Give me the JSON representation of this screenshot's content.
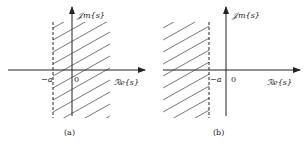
{
  "figure": {
    "panels": [
      {
        "id": "a",
        "caption": "(a)",
        "axes": {
          "x_label": "ℛe{s}",
          "y_label": "𝒥m{s}"
        },
        "marks": {
          "boundary_label": "−a",
          "origin_label": "0"
        },
        "region": "Re{s} > −a (right half-plane shaded)",
        "boundary_style": "dashed"
      },
      {
        "id": "b",
        "caption": "(b)",
        "axes": {
          "x_label": "ℛe{s}",
          "y_label": "𝒥m{s}"
        },
        "marks": {
          "boundary_label": "−a",
          "origin_label": "0"
        },
        "region": "Re{s} < −a (left half-plane shaded)",
        "boundary_style": "dashed"
      }
    ],
    "colors": {
      "line": "#222222",
      "hatch": "#555555",
      "background": "#ffffff"
    }
  }
}
